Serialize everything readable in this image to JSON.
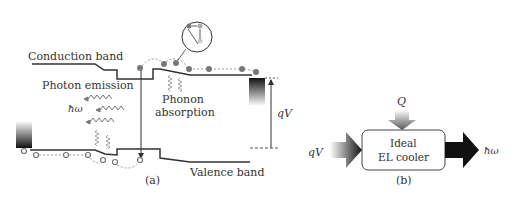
{
  "panel_a": {
    "label": "(a)",
    "conduction_band_label": "Conduction band",
    "valence_band_label": "Valence band",
    "photon_emission_label": "Photon emission",
    "photon_energy_label": "ħω",
    "phonon_label_line1": "Phonon",
    "phonon_label_line2": "absorption",
    "voltage_label": "qV"
  },
  "panel_b": {
    "label": "(b)",
    "box_line1": "Ideal",
    "box_line2": "EL cooler",
    "input_label": "qV",
    "heat_label": "Q",
    "output_label": "ħω"
  },
  "colors": {
    "line": "#333333",
    "electron": "#777777",
    "dashed": "#999999"
  }
}
